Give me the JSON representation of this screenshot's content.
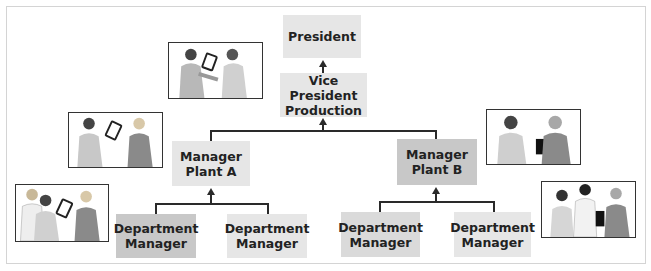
{
  "diagram": {
    "type": "organization-chart",
    "caption": "",
    "nodes": [
      {
        "id": "president",
        "label": "President",
        "level": 0
      },
      {
        "id": "vp-production",
        "label": "Vice President\nProduction",
        "line1": "Vice President",
        "line2": "Production",
        "level": 1
      },
      {
        "id": "manager-plant-a",
        "line1": "Manager",
        "line2": "Plant A",
        "level": 2
      },
      {
        "id": "manager-plant-b",
        "line1": "Manager",
        "line2": "Plant B",
        "level": 2
      },
      {
        "id": "dept-manager-a1",
        "line1": "Department",
        "line2": "Manager",
        "level": 3
      },
      {
        "id": "dept-manager-a2",
        "line1": "Department",
        "line2": "Manager",
        "level": 3
      },
      {
        "id": "dept-manager-b1",
        "line1": "Department",
        "line2": "Manager",
        "level": 3
      },
      {
        "id": "dept-manager-b2",
        "line1": "Department",
        "line2": "Manager",
        "level": 3
      }
    ],
    "edges": [
      {
        "from": "vp-production",
        "to": "president"
      },
      {
        "from": "manager-plant-a",
        "to": "vp-production"
      },
      {
        "from": "manager-plant-b",
        "to": "vp-production"
      },
      {
        "from": "dept-manager-a1",
        "to": "manager-plant-a"
      },
      {
        "from": "dept-manager-a2",
        "to": "manager-plant-a"
      },
      {
        "from": "dept-manager-b1",
        "to": "manager-plant-b"
      },
      {
        "from": "dept-manager-b2",
        "to": "manager-plant-b"
      }
    ],
    "illustrations": [
      {
        "id": "photo-vp-meeting",
        "description": "two people exchanging a tablet"
      },
      {
        "id": "photo-plant-a",
        "description": "two women exchanging a tablet"
      },
      {
        "id": "photo-plant-b",
        "description": "two people, one holding a laptop"
      },
      {
        "id": "photo-dept-a",
        "description": "three people with a tablet"
      },
      {
        "id": "photo-dept-b",
        "description": "three people, one holding a laptop"
      }
    ],
    "colors": {
      "box_light": "#e6e6e6",
      "box_mid": "#dadada",
      "box_dark": "#c8c8c8",
      "connector": "#2a2a2a",
      "text": "#222222"
    }
  }
}
